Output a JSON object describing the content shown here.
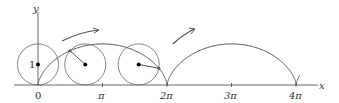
{
  "figure": {
    "axes": {
      "x_label": "x",
      "y_label": "y",
      "y_tick": "1",
      "x_ticks": [
        "0",
        "π",
        "2π",
        "3π",
        "4π"
      ],
      "x_tick_values": [
        0,
        3.14159,
        6.28318,
        9.42478,
        12.56637
      ]
    },
    "circles": [
      {
        "name": "circle-at-0",
        "center_x": 0,
        "theta": 0
      },
      {
        "name": "circle-at-early",
        "center_x": 2.3,
        "theta": 2.3
      },
      {
        "name": "circle-at-late",
        "center_x": 4.9,
        "theta": 4.9
      }
    ],
    "colors": {
      "curve": "#555555",
      "axes": "#444444",
      "circle": "#666666",
      "dot": "#000000"
    }
  }
}
